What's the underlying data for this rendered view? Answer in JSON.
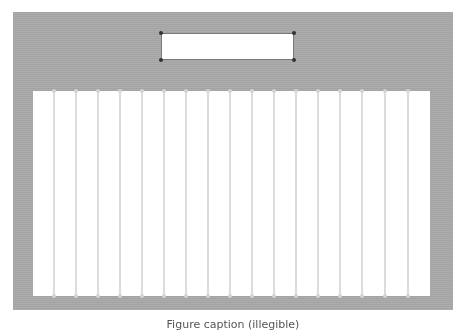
{
  "figure": {
    "caption": "Figure caption (illegible)"
  },
  "top_box": {
    "handles": [
      "top-left",
      "top-right",
      "bottom-left",
      "bottom-right"
    ]
  },
  "panel": {
    "vertical_lines_x": [
      54,
      76,
      98,
      120,
      142,
      164,
      186,
      208,
      230,
      252,
      274,
      296,
      318,
      340,
      362,
      385,
      408
    ]
  },
  "colors": {
    "backdrop": "#a9a9a9",
    "panel": "#ffffff",
    "lines": "#dcdcdc",
    "handles": "#333333"
  }
}
